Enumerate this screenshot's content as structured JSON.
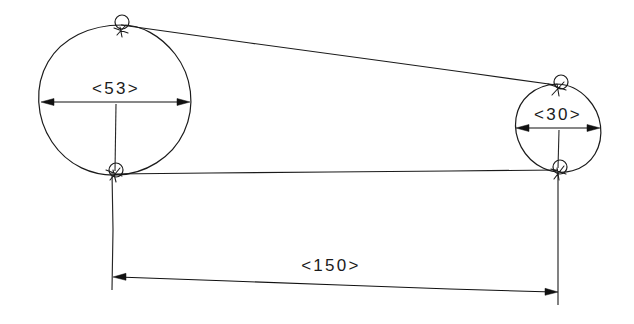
{
  "drawing": {
    "title": "Belt drive layout sketch",
    "style": "hand-drawn engineering sketch",
    "background_color": "#ffffff",
    "line_color": "#1b1b1b",
    "canvas": {
      "width": 634,
      "height": 324
    }
  },
  "dimensions": [
    {
      "id": "large-pulley-diameter",
      "label": "<53>",
      "value": 53,
      "kind": "diameter",
      "applies_to": "left-pulley",
      "text_x": 116,
      "text_y": 94,
      "line_y": 102,
      "x_start": 41,
      "x_end": 190
    },
    {
      "id": "small-pulley-diameter",
      "label": "<30>",
      "value": 30,
      "kind": "diameter",
      "applies_to": "right-pulley",
      "text_x": 558,
      "text_y": 120,
      "line_y": 128,
      "x_start": 516,
      "x_end": 600
    },
    {
      "id": "center-distance",
      "label": "<150>",
      "value": 150,
      "kind": "center-distance",
      "applies_to": "left-pulley-to-right-pulley",
      "text_x": 331,
      "text_y": 271,
      "x_start": 113,
      "y_start": 277,
      "x_end": 558,
      "y_end": 292
    }
  ],
  "pulleys": [
    {
      "id": "left-pulley",
      "name": "large-pulley",
      "cx": 115.5,
      "cy": 100,
      "r": 75,
      "diameter_label": "<53>"
    },
    {
      "id": "right-pulley",
      "name": "small-pulley",
      "cx": 558,
      "cy": 127,
      "r": 43,
      "diameter_label": "<30>"
    }
  ],
  "tangent_nodes": [
    {
      "id": "node-upper-left",
      "x": 122,
      "y": 25,
      "r": 7
    },
    {
      "id": "node-lower-left",
      "x": 113,
      "y": 173,
      "r": 7
    },
    {
      "id": "node-upper-right",
      "x": 555,
      "y": 85,
      "r": 7
    },
    {
      "id": "node-lower-right",
      "x": 558,
      "y": 170,
      "r": 7
    }
  ],
  "belt_spans": [
    {
      "id": "belt-upper-span",
      "x1": 122,
      "y1": 25,
      "x2": 555,
      "y2": 85
    },
    {
      "id": "belt-lower-span",
      "x1": 113,
      "y1": 174,
      "x2": 558,
      "y2": 170
    }
  ]
}
